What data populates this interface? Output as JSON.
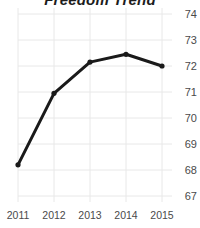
{
  "chart_data": {
    "type": "line",
    "title": "Freedom Trend",
    "xlabel": "",
    "ylabel": "",
    "categories": [
      "2011",
      "2012",
      "2013",
      "2014",
      "2015"
    ],
    "x": [
      2011,
      2012,
      2013,
      2014,
      2015
    ],
    "values": [
      68.2,
      70.95,
      72.15,
      72.45,
      72.0
    ],
    "series": [
      {
        "name": "Freedom Trend",
        "values": [
          68.2,
          70.95,
          72.15,
          72.45,
          72.0
        ]
      }
    ],
    "ylim": [
      66.5,
      74.4
    ],
    "yticks": [
      74,
      73,
      72,
      71,
      70,
      69,
      68,
      67
    ],
    "ytick_labels": [
      "74",
      "73",
      "72",
      "71",
      "70",
      "69",
      "68",
      "67"
    ],
    "xtick_labels": [
      "2011",
      "2012",
      "2013",
      "2014",
      "2015"
    ],
    "grid": true,
    "grid_color": "#e8e8e8",
    "legend": false,
    "legend_position": "none",
    "y_axis_side": "right",
    "line_color": "#1a1a1a",
    "marker": "circle",
    "marker_color": "#1a1a1a",
    "annotations": []
  },
  "axis": {
    "y_labels": [
      {
        "text": "74",
        "y": 14
      },
      {
        "text": "73",
        "y": 40
      },
      {
        "text": "72",
        "y": 66
      },
      {
        "text": "71",
        "y": 92
      },
      {
        "text": "70",
        "y": 118
      },
      {
        "text": "69",
        "y": 144
      },
      {
        "text": "68",
        "y": 170
      },
      {
        "text": "67",
        "y": 196
      }
    ],
    "x_labels": [
      {
        "text": "2011",
        "x": 18
      },
      {
        "text": "2012",
        "x": 54
      },
      {
        "text": "2013",
        "x": 90
      },
      {
        "text": "2014",
        "x": 126
      },
      {
        "text": "2015",
        "x": 162
      }
    ]
  }
}
